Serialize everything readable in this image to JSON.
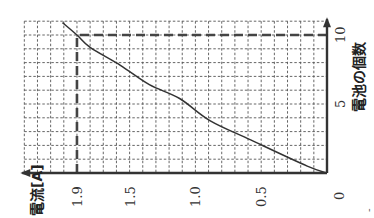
{
  "chart_data": {
    "type": "line",
    "orientation": "rotated 90° clockwise (x-axis runs upward along right edge, y-axis runs leftward along bottom)",
    "title": "",
    "xlabel": "電池の個数",
    "ylabel": "電流[A]",
    "xlim": [
      0,
      11
    ],
    "ylim": [
      0,
      2.3
    ],
    "x_ticks": [
      {
        "value": 0,
        "label": "0"
      },
      {
        "value": 5,
        "label": "5"
      },
      {
        "value": 10,
        "label": "10"
      }
    ],
    "y_ticks": [
      {
        "value": 0.5,
        "label": "0.5"
      },
      {
        "value": 1.0,
        "label": "1.0"
      },
      {
        "value": 1.5,
        "label": "1.5"
      },
      {
        "value": 1.9,
        "label": "1.9"
      }
    ],
    "grid": true,
    "grid_step_x": 1,
    "grid_step_y": 0.1,
    "series": [
      {
        "name": "電流",
        "x": [
          0,
          0.5,
          2.4,
          3.8,
          5.4,
          6.4,
          7.8,
          9.1,
          10,
          10.9
        ],
        "y": [
          0,
          0.15,
          0.58,
          0.89,
          1.12,
          1.35,
          1.57,
          1.8,
          1.9,
          2.01
        ]
      }
    ],
    "annotations": [
      {
        "type": "guide-line",
        "x": 10,
        "y": 1.9,
        "description": "dashed lines from axes to point (10, 1.9)"
      }
    ],
    "origin_label": "0",
    "footer_mark": "-"
  }
}
